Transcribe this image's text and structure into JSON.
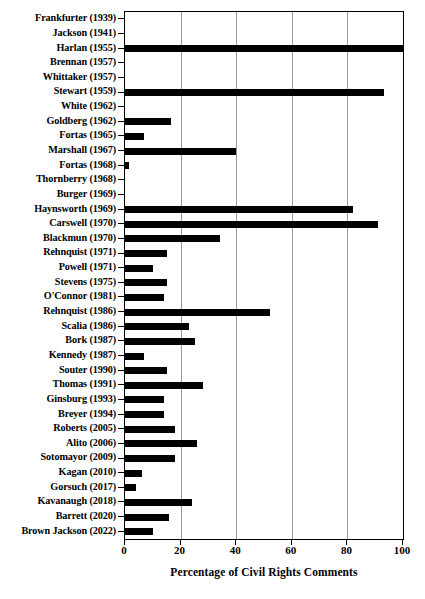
{
  "chart_data": {
    "type": "bar",
    "orientation": "horizontal",
    "title": "",
    "xlabel": "Percentage of Civil Rights Comments",
    "ylabel": "",
    "xlim": [
      0,
      100
    ],
    "xticks": [
      0,
      20,
      40,
      60,
      80,
      100
    ],
    "xticklabels": [
      "0",
      "20",
      "40",
      "60",
      "80",
      "100"
    ],
    "grid": true,
    "grid_axis": "x",
    "legend": null,
    "bar_color": "#000000",
    "categories": [
      "Frankfurter (1939)",
      "Jackson (1941)",
      "Harlan (1955)",
      "Brennan (1957)",
      "Whittaker (1957)",
      "Stewart (1959)",
      "White (1962)",
      "Goldberg (1962)",
      "Fortas (1965)",
      "Marshall (1967)",
      "Fortas (1968)",
      "Thornberry (1968)",
      "Burger (1969)",
      "Haynsworth (1969)",
      "Carswell (1970)",
      "Blackmun (1970)",
      "Rehnquist (1971)",
      "Powell (1971)",
      "Stevens (1975)",
      "O'Connor (1981)",
      "Rehnquist (1986)",
      "Scalia (1986)",
      "Bork (1987)",
      "Kennedy (1987)",
      "Souter (1990)",
      "Thomas (1991)",
      "Ginsburg (1993)",
      "Breyer (1994)",
      "Roberts (2005)",
      "Alito (2006)",
      "Sotomayor (2009)",
      "Kagan (2010)",
      "Gorsuch (2017)",
      "Kavanaugh (2018)",
      "Barrett (2020)",
      "Brown Jackson (2022)"
    ],
    "values": [
      0,
      0,
      100,
      0,
      0,
      93,
      0,
      16.5,
      7,
      40,
      1.5,
      0,
      0,
      82,
      91,
      34,
      15,
      10,
      15,
      14,
      52,
      23,
      25,
      7,
      15,
      28,
      14,
      14,
      18,
      26,
      18,
      6,
      4,
      24,
      16,
      10
    ]
  }
}
